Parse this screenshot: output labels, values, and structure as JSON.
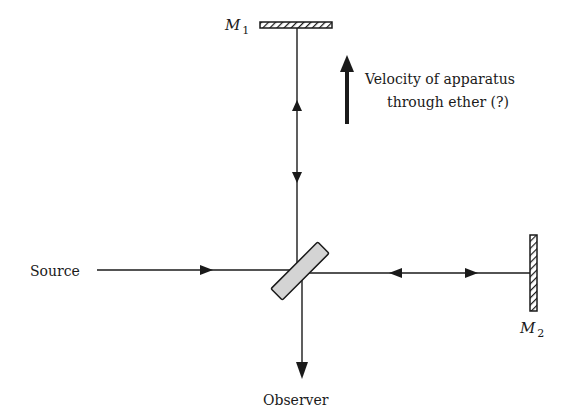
{
  "diagram": {
    "labels": {
      "mirror1": "M",
      "mirror1_sub": "1",
      "mirror2": "M",
      "mirror2_sub": "2",
      "source": "Source",
      "observer": "Observer",
      "velocity_line1": "Velocity of apparatus",
      "velocity_line2": "through ether (?)"
    },
    "colors": {
      "ink": "#1a1a1a",
      "splitter_fill": "#d4d4d4",
      "background": "#ffffff"
    }
  }
}
